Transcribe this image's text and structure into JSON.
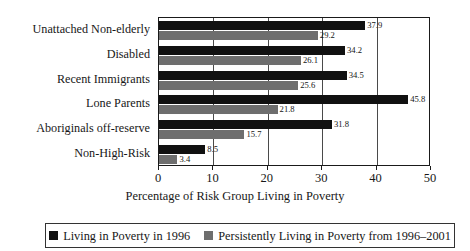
{
  "chart_data": {
    "type": "bar",
    "orientation": "horizontal",
    "title": "",
    "xlabel": "Percentage of Risk Group Living in Poverty",
    "ylabel": "",
    "xlim": [
      0,
      50
    ],
    "xticks": [
      0,
      10,
      20,
      30,
      40,
      50
    ],
    "xtick_labels": [
      "0",
      "10",
      "20",
      "30",
      "40",
      "50"
    ],
    "grid": true,
    "grid_axis": "x",
    "legend_position": "bottom",
    "categories": [
      "Unattached Non-elderly",
      "Disabled",
      "Recent Immigrants",
      "Lone Parents",
      "Aboriginals off-reserve",
      "Non-High-Risk"
    ],
    "series": [
      {
        "name": "Living in Poverty in 1996",
        "color": "#111111",
        "values": [
          37.9,
          34.2,
          34.5,
          45.8,
          31.8,
          8.5
        ],
        "value_labels": [
          "37.9",
          "34.2",
          "34.5",
          "45.8",
          "31.8",
          "8.5"
        ]
      },
      {
        "name": "Persistently Living in Poverty from 1996–2001",
        "color": "#6e6e6e",
        "values": [
          29.2,
          26.1,
          25.6,
          21.8,
          15.7,
          3.4
        ],
        "value_labels": [
          "29.2",
          "26.1",
          "25.6",
          "21.8",
          "15.7",
          "3.4"
        ]
      }
    ]
  },
  "legend": {
    "entries": [
      {
        "label": "Living in Poverty in 1996",
        "color": "#111111"
      },
      {
        "label": "Persistently Living in Poverty from 1996–2001",
        "color": "#6e6e6e"
      }
    ]
  }
}
